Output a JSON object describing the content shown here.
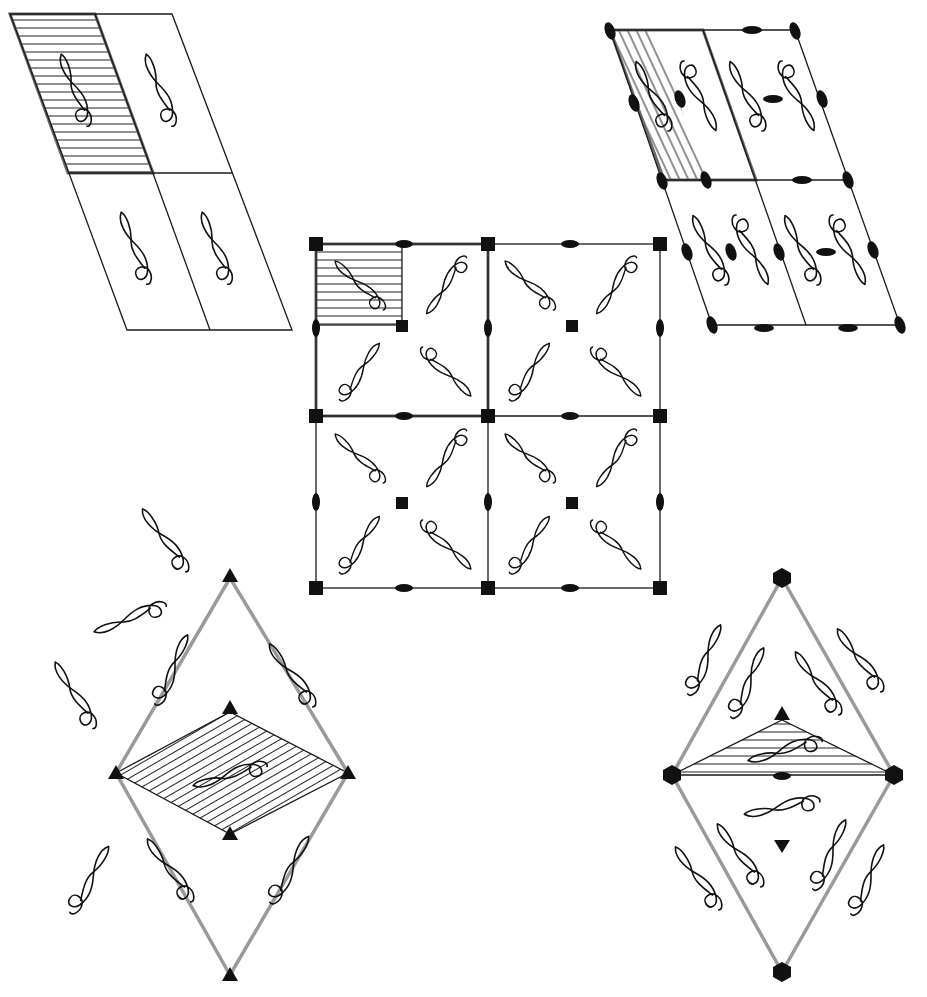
{
  "figure": {
    "colors": {
      "line": "#1a1a1a",
      "unit_edge": "#9a9a9a",
      "symbol": "#111111",
      "background": "#ffffff"
    }
  },
  "motif": {
    "name": "treble-clef-like curl",
    "icon": "motif-icon"
  },
  "panels": [
    {
      "id": "p1",
      "position": "top-left",
      "lattice": "oblique",
      "cells": "2x2 parallelograms",
      "symmetry_elements": [],
      "motifs_per_cell": 1,
      "hatched_region": "upper-left cell, horizontal hatching"
    },
    {
      "id": "p2",
      "position": "top-right",
      "lattice": "oblique",
      "cells": "2x2 parallelograms",
      "symmetry_elements": [
        "2-fold (ellipse) at corners, edge midpoints and cell centers"
      ],
      "motifs_per_cell": 2,
      "hatched_region": "left half of upper-left cell, diagonal hatching"
    },
    {
      "id": "p4",
      "position": "center",
      "lattice": "square",
      "cells": "2x2 squares",
      "symmetry_elements": [
        "4-fold (square) at corners and cell centers",
        "2-fold (ellipse) at edge midpoints"
      ],
      "motifs_per_cell": 4,
      "hatched_region": "upper-left quarter of upper-left cell, horizontal hatching"
    },
    {
      "id": "p3",
      "position": "bottom-left",
      "lattice": "hexagonal",
      "cells": "rhombus",
      "symmetry_elements": [
        "3-fold (triangle) at rhombus vertices and inner points"
      ],
      "motifs_per_cell": 3,
      "hatched_region": "inner rhombus, diagonal hatching"
    },
    {
      "id": "p6",
      "position": "bottom-right",
      "lattice": "hexagonal",
      "cells": "rhombus",
      "symmetry_elements": [
        "6-fold (hexagon) at rhombus vertices",
        "3-fold (triangle) at inner points",
        "2-fold (ellipse) at center of short diagonal"
      ],
      "motifs_per_cell": 6,
      "hatched_region": "upper triangle above short diagonal, horizontal hatching"
    }
  ]
}
